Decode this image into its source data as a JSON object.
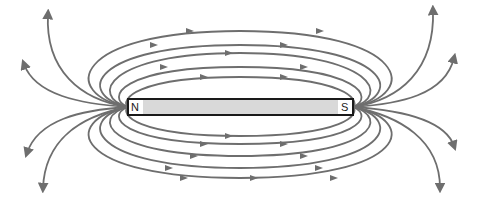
{
  "diagram": {
    "magnet": {
      "north_label": "N",
      "south_label": "S",
      "fill": "#d9d9d9",
      "outline": "#1a1a1a"
    },
    "field_lines": {
      "color": "#6e6e6e",
      "direction": "from N to S (outside magnet)",
      "closed_loops_above": 5,
      "closed_loops_below": 5,
      "open_lines_left": 4,
      "open_lines_right": 4
    }
  }
}
